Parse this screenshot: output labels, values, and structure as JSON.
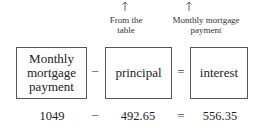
{
  "annotations": [
    {
      "arrow": "up-arrow",
      "text_line1": "From the",
      "text_line2": "table"
    },
    {
      "arrow": "up-arrow",
      "text_line1": "Monthly mortgage",
      "text_line2": "payment"
    }
  ],
  "equation": {
    "boxes": [
      {
        "line1": "Monthly",
        "line2": "mortgage",
        "line3": "payment"
      },
      {
        "line1": "principal"
      },
      {
        "line1": "interest"
      }
    ],
    "operators": [
      "−",
      "="
    ]
  },
  "values": {
    "a": "1049",
    "op1": "−",
    "b": "492.65",
    "op2": "=",
    "c": "556.35"
  }
}
